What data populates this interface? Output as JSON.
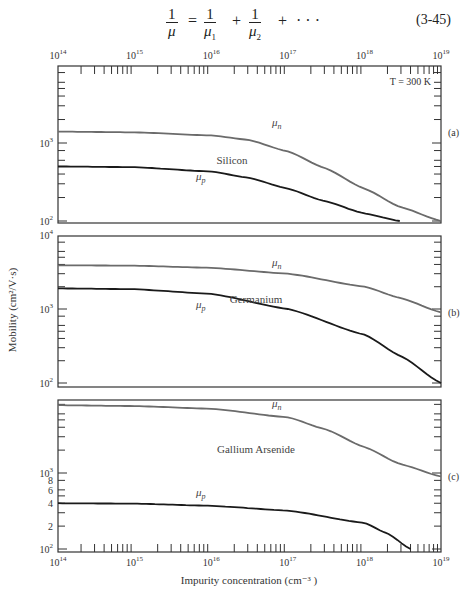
{
  "equation": {
    "lhs_num": "1",
    "lhs_den": "μ",
    "t1_num": "1",
    "t1_den": "μ",
    "t1_sub": "1",
    "t2_num": "1",
    "t2_den": "μ",
    "t2_sub": "2",
    "equals": "=",
    "plus1": "+",
    "plus2": "+",
    "ellipsis": "· · ·",
    "number": "(3-45)"
  },
  "chart_data": {
    "type": "line",
    "xlabel": "Impurity concentration (cm⁻³ )",
    "ylabel": "Mobility (cm²/V·s)",
    "xscale": "log",
    "xlim": [
      100000000000000.0,
      1e+19
    ],
    "top_tick_labels": [
      {
        "base": "10",
        "exp": "14"
      },
      {
        "base": "10",
        "exp": "15"
      },
      {
        "base": "10",
        "exp": "16"
      },
      {
        "base": "10",
        "exp": "17"
      },
      {
        "base": "10",
        "exp": "18"
      },
      {
        "base": "10",
        "exp": "19"
      }
    ],
    "bottom_tick_labels": [
      {
        "base": "10",
        "exp": "14"
      },
      {
        "base": "10",
        "exp": "15"
      },
      {
        "base": "10",
        "exp": "16"
      },
      {
        "base": "10",
        "exp": "17"
      },
      {
        "base": "10",
        "exp": "18"
      },
      {
        "base": "10",
        "exp": "19"
      }
    ],
    "annotation": "T = 300 K",
    "panels": [
      {
        "id": "a",
        "panel_label": "(a)",
        "material": "Silicon",
        "yscale": "log",
        "ylim": [
          100,
          10000
        ],
        "y_tick_labels": [
          {
            "base": "10",
            "exp": "3",
            "value": 1000
          },
          {
            "base": "10",
            "exp": "2",
            "value": 100
          }
        ],
        "series": [
          {
            "name": "μn",
            "label_base": "μ",
            "label_sub": "n",
            "color": "#6b6b6b",
            "x": [
              100000000000000.0,
              1000000000000000.0,
              1e+16,
              3e+16,
              1e+17,
              3e+17,
              1e+18,
              3e+18,
              1e+19
            ],
            "y": [
              1400,
              1370,
              1250,
              1100,
              780,
              480,
              260,
              150,
              100
            ]
          },
          {
            "name": "μp",
            "label_base": "μ",
            "label_sub": "p",
            "color": "#1a1a1a",
            "x": [
              100000000000000.0,
              1000000000000000.0,
              1e+16,
              3e+16,
              1e+17,
              3e+17,
              1e+18,
              2.9e+18
            ],
            "y": [
              500,
              490,
              430,
              360,
              260,
              180,
              125,
              100
            ]
          }
        ]
      },
      {
        "id": "b",
        "panel_label": "(b)",
        "material": "Germanium",
        "yscale": "log",
        "ylim": [
          100,
          10000
        ],
        "y_tick_labels": [
          {
            "base": "10",
            "exp": "4",
            "value": 10000
          },
          {
            "base": "10",
            "exp": "3",
            "value": 1000
          },
          {
            "base": "10",
            "exp": "2",
            "value": 100
          }
        ],
        "series": [
          {
            "name": "μn",
            "label_base": "μ",
            "label_sub": "n",
            "color": "#6b6b6b",
            "x": [
              100000000000000.0,
              1000000000000000.0,
              1e+16,
              1e+17,
              1e+18,
              3e+18,
              1e+19
            ],
            "y": [
              3900,
              3850,
              3600,
              3000,
              2000,
              1400,
              900
            ]
          },
          {
            "name": "μp",
            "label_base": "μ",
            "label_sub": "p",
            "color": "#1a1a1a",
            "x": [
              100000000000000.0,
              1000000000000000.0,
              1e+16,
              1e+17,
              1e+18,
              3e+18,
              1e+19
            ],
            "y": [
              1900,
              1850,
              1600,
              1000,
              450,
              230,
              100
            ]
          }
        ]
      },
      {
        "id": "c",
        "panel_label": "(c)",
        "material": "Gallium Arsenide",
        "yscale": "log",
        "ylim": [
          100,
          10000
        ],
        "y_tick_labels": [
          {
            "base": "10",
            "exp": "3",
            "value": 1000
          },
          {
            "base": "8",
            "exp": "",
            "value": 800
          },
          {
            "base": "6",
            "exp": "",
            "value": 600
          },
          {
            "base": "4",
            "exp": "",
            "value": 400
          },
          {
            "base": "2",
            "exp": "",
            "value": 200
          },
          {
            "base": "10",
            "exp": "2",
            "value": 100
          }
        ],
        "series": [
          {
            "name": "μn",
            "label_base": "μ",
            "label_sub": "n",
            "color": "#6b6b6b",
            "x": [
              100000000000000.0,
              1000000000000000.0,
              1e+16,
              1e+17,
              3e+17,
              1e+18,
              3e+18,
              1e+19
            ],
            "y": [
              7800,
              7600,
              7000,
              5400,
              3800,
              2200,
              1300,
              900
            ]
          },
          {
            "name": "μp",
            "label_base": "μ",
            "label_sub": "p",
            "color": "#1a1a1a",
            "x": [
              100000000000000.0,
              1000000000000000.0,
              1e+16,
              1e+17,
              1e+18,
              2e+18,
              4e+18
            ],
            "y": [
              400,
              395,
              370,
              320,
              220,
              160,
              100
            ]
          }
        ]
      }
    ]
  }
}
